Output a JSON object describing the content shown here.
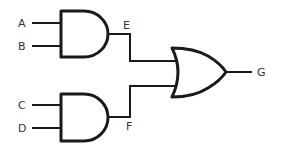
{
  "diagram": {
    "type": "logic-circuit",
    "colors": {
      "stroke": "#1a1a1a",
      "label": "#333333",
      "background": "#ffffff"
    },
    "gates": [
      {
        "id": "and1",
        "kind": "AND",
        "inputs": [
          "A",
          "B"
        ],
        "output": "E"
      },
      {
        "id": "and2",
        "kind": "AND",
        "inputs": [
          "C",
          "D"
        ],
        "output": "F"
      },
      {
        "id": "or1",
        "kind": "OR",
        "inputs": [
          "E",
          "F"
        ],
        "output": "G"
      }
    ],
    "labels": {
      "A": "A",
      "B": "B",
      "C": "C",
      "D": "D",
      "E": "E",
      "F": "F",
      "G": "G"
    }
  }
}
